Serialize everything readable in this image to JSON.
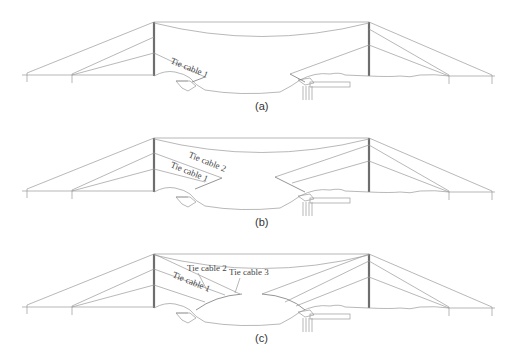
{
  "figure": {
    "panels": [
      {
        "id": "a",
        "caption": "(a)",
        "offset_y": 0,
        "labels": [
          {
            "text": "Tie cable 1",
            "x": 170,
            "y": 73,
            "rotate": 22
          }
        ]
      },
      {
        "id": "b",
        "caption": "(b)",
        "offset_y": 116,
        "labels": [
          {
            "text": "Tie cable 2",
            "x": 188,
            "y": 46,
            "rotate": 22
          },
          {
            "text": "Tie cable 1",
            "x": 170,
            "y": 57,
            "rotate": 22
          }
        ]
      },
      {
        "id": "c",
        "caption": "(c)",
        "offset_y": 232,
        "labels": [
          {
            "text": "Tie cable 2",
            "x": 187,
            "y": 38,
            "rotate": 0
          },
          {
            "text": "Tie cable 3",
            "x": 229,
            "y": 42,
            "rotate": 0
          },
          {
            "text": "Tie cable 1",
            "x": 172,
            "y": 50,
            "rotate": 22
          }
        ]
      }
    ],
    "line_color": "#9a9a9a",
    "tower_color": "#6e6e6e"
  }
}
